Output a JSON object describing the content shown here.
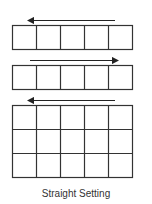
{
  "diagram": {
    "caption": "Straight Setting",
    "line_color": "#333333",
    "blocks": [
      {
        "name": "row-1",
        "rows": 1,
        "cols": 5,
        "arrow_direction": "left"
      },
      {
        "name": "row-2",
        "rows": 1,
        "cols": 5,
        "arrow_direction": "right"
      },
      {
        "name": "grid-3",
        "rows": 3,
        "cols": 5,
        "arrow_direction": "left"
      }
    ]
  }
}
